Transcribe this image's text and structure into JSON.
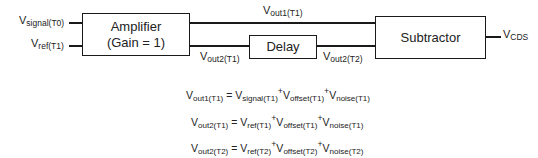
{
  "blocks": {
    "amplifier": {
      "line1": "Amplifier",
      "line2": "(Gain = 1)"
    },
    "delay": {
      "label": "Delay"
    },
    "subtractor": {
      "label": "Subtractor"
    }
  },
  "signals": {
    "input_signal": {
      "base": "V",
      "sub": "signal(T0)"
    },
    "input_ref": {
      "base": "V",
      "sub": "ref(T1)"
    },
    "out1_t1": {
      "base": "V",
      "sub": "out1(T1)"
    },
    "out2_t1": {
      "base": "V",
      "sub": "out2(T1)"
    },
    "out2_t2": {
      "base": "V",
      "sub": "out2(T2)"
    },
    "output_cds": {
      "base": "V",
      "sub": "CDS"
    }
  },
  "equations": [
    {
      "lhs": {
        "base": "V",
        "sub": "out1(T1)"
      },
      "eq": " = ",
      "terms": [
        {
          "base": "V",
          "sub": "signal(T1)"
        },
        {
          "base": "V",
          "sub": "offset(T1)"
        },
        {
          "base": "V",
          "sub": "noise(T1)"
        }
      ]
    },
    {
      "lhs": {
        "base": "V",
        "sub": "out2(T1)"
      },
      "eq": " = ",
      "terms": [
        {
          "base": "V",
          "sub": "ref(T1)"
        },
        {
          "base": "V",
          "sub": "offset(T1)"
        },
        {
          "base": "V",
          "sub": "noise(T1)"
        }
      ]
    },
    {
      "lhs": {
        "base": "V",
        "sub": "out2(T2)"
      },
      "eq": " = ",
      "terms": [
        {
          "base": "V",
          "sub": "ref(T2)"
        },
        {
          "base": "V",
          "sub": "offset(T2)"
        },
        {
          "base": "V",
          "sub": "noise(T2)"
        }
      ]
    }
  ],
  "plus": "+"
}
